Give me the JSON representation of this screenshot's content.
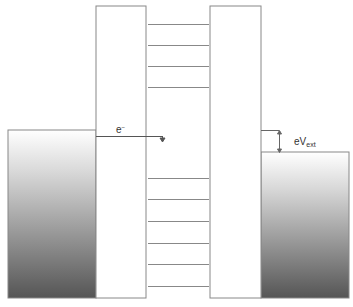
{
  "diagram": {
    "labels": {
      "electron": "e",
      "electron_sup": "−",
      "bias_main": "eV",
      "bias_sub": "ext"
    },
    "components": {
      "left_electrode": {
        "x": 8,
        "top": 130,
        "right": 96,
        "bottom": 298
      },
      "left_barrier": {
        "x1": 96,
        "x2": 146,
        "top": 6,
        "bottom": 298
      },
      "well": {
        "x1": 146,
        "x2": 210
      },
      "right_barrier": {
        "x1": 210,
        "x2": 261,
        "top": 6,
        "bottom": 298
      },
      "right_electrode": {
        "x": 261,
        "top": 152,
        "right": 349,
        "bottom": 298
      }
    },
    "energy_levels_upper": [
      24,
      45,
      66,
      87
    ],
    "energy_levels_lower": [
      178,
      199,
      221,
      243,
      264,
      286
    ],
    "colors": {
      "line": "#888888",
      "gradient_top": "#ffffff",
      "gradient_bottom": "#555555"
    }
  }
}
